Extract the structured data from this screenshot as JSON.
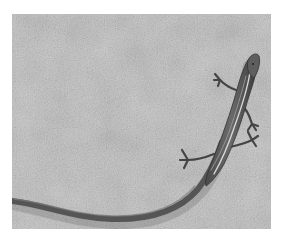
{
  "image": {
    "alt": "Grayscale photograph of a slender lizard with a long curving tail on a speckled concrete surface",
    "subject": "lizard",
    "surface": "concrete",
    "color_mode": "grayscale",
    "colors": {
      "background": "#ffffff",
      "concrete": "#b9b9b9",
      "concrete_light": "#cfcfcf",
      "concrete_dark": "#8e8e8e",
      "lizard_body": "#5c5c5c",
      "lizard_dark": "#3a3a3a",
      "lizard_stripe": "#d8d8d8"
    }
  }
}
